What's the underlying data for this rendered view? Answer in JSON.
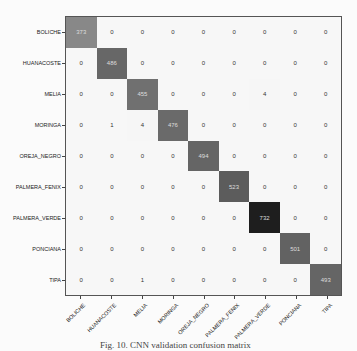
{
  "chart_data": {
    "type": "heatmap",
    "title": "",
    "xlabel": "",
    "ylabel": "",
    "categories": [
      "BOLICHE",
      "HUANACOSTE",
      "MELIA",
      "MORINGA",
      "OREJA_NEGRO",
      "PALMERA_FENIX",
      "PALMERA_VERDE",
      "PONCIANA",
      "TIPA"
    ],
    "rows": [
      "BOLICHE",
      "HUANACOSTE",
      "MELIA",
      "MORINGA",
      "OREJA_NEGRO",
      "PALMERA_FENIX",
      "PALMERA_VERDE",
      "PONCIANA",
      "TIPA"
    ],
    "columns": [
      "BOLICHE",
      "HUANACOSTE",
      "MELIA",
      "MORINGA",
      "OREJA_NEGRO",
      "PALMERA_FENIX",
      "PALMERA_VERDE",
      "PONCIANA",
      "TIPA"
    ],
    "values": [
      [
        373,
        0,
        0,
        0,
        0,
        0,
        0,
        0,
        0
      ],
      [
        0,
        486,
        0,
        0,
        0,
        0,
        0,
        0,
        0
      ],
      [
        0,
        0,
        455,
        0,
        0,
        0,
        4,
        0,
        0
      ],
      [
        0,
        1,
        4,
        476,
        0,
        0,
        0,
        0,
        0
      ],
      [
        0,
        0,
        0,
        0,
        494,
        0,
        0,
        0,
        0
      ],
      [
        0,
        0,
        0,
        0,
        0,
        523,
        0,
        0,
        0
      ],
      [
        0,
        0,
        0,
        0,
        0,
        0,
        732,
        0,
        0
      ],
      [
        0,
        0,
        0,
        0,
        0,
        0,
        0,
        501,
        0
      ],
      [
        0,
        0,
        1,
        0,
        0,
        0,
        0,
        0,
        493
      ]
    ],
    "colormap": "greys",
    "vmax": 732,
    "grid": false,
    "legend": "none"
  },
  "caption": "Fig. 10. CNN validation confusion matrix"
}
